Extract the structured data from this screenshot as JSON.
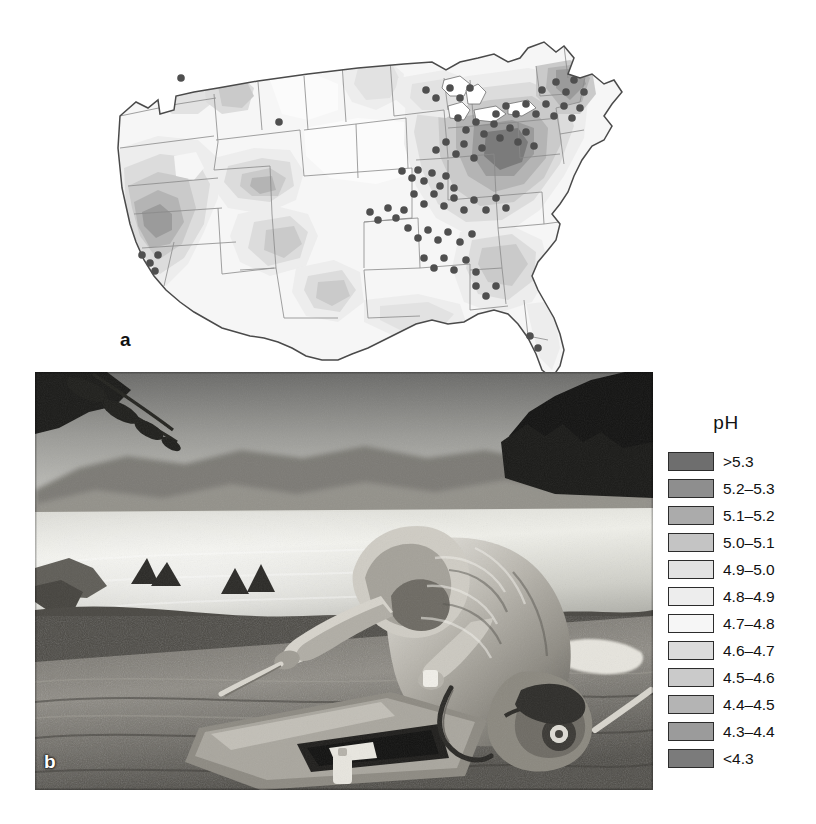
{
  "figure": {
    "panels": [
      {
        "id": "a",
        "label": "a",
        "kind": "map",
        "description": "Contour map of the contiguous United States showing precipitation pH, with monitoring-station dots concentrated in the eastern states"
      },
      {
        "id": "b",
        "label": "b",
        "kind": "photograph",
        "description": "Researcher in a hooded rain jacket crouching at a lake shore, collecting a water sample beside an open field instrument case"
      }
    ]
  },
  "legend": {
    "title": "pH",
    "entries": [
      {
        "label": ">5.3",
        "color": "#6e6e6e"
      },
      {
        "label": "5.2–5.3",
        "color": "#8e8e8e"
      },
      {
        "label": "5.1–5.2",
        "color": "#ababab"
      },
      {
        "label": "5.0–5.1",
        "color": "#c4c4c4"
      },
      {
        "label": "4.9–5.0",
        "color": "#e2e2e2"
      },
      {
        "label": "4.8–4.9",
        "color": "#ededed"
      },
      {
        "label": "4.7–4.8",
        "color": "#f6f6f6"
      },
      {
        "label": "4.6–4.7",
        "color": "#dcdcdc"
      },
      {
        "label": "4.5–4.6",
        "color": "#cacaca"
      },
      {
        "label": "4.4–4.5",
        "color": "#b4b4b4"
      },
      {
        "label": "4.3–4.4",
        "color": "#9b9b9b"
      },
      {
        "label": "<4.3",
        "color": "#7b7b7b"
      }
    ]
  },
  "chart_data": {
    "type": "map",
    "title": "pH",
    "variable": "precipitation pH",
    "region": "Contiguous United States",
    "grid": false,
    "legend_position": "right",
    "classes": [
      {
        "label": ">5.3",
        "min": 5.3,
        "max": null,
        "color": "#6e6e6e"
      },
      {
        "label": "5.2–5.3",
        "min": 5.2,
        "max": 5.3,
        "color": "#8e8e8e"
      },
      {
        "label": "5.1–5.2",
        "min": 5.1,
        "max": 5.2,
        "color": "#ababab"
      },
      {
        "label": "5.0–5.1",
        "min": 5.0,
        "max": 5.1,
        "color": "#c4c4c4"
      },
      {
        "label": "4.9–5.0",
        "min": 4.9,
        "max": 5.0,
        "color": "#e2e2e2"
      },
      {
        "label": "4.8–4.9",
        "min": 4.8,
        "max": 4.9,
        "color": "#ededed"
      },
      {
        "label": "4.7–4.8",
        "min": 4.7,
        "max": 4.8,
        "color": "#f6f6f6"
      },
      {
        "label": "4.6–4.7",
        "min": 4.6,
        "max": 4.7,
        "color": "#dcdcdc"
      },
      {
        "label": "4.5–4.6",
        "min": 4.5,
        "max": 4.6,
        "color": "#cacaca"
      },
      {
        "label": "4.4–4.5",
        "min": 4.4,
        "max": 4.5,
        "color": "#b4b4b4"
      },
      {
        "label": "4.3–4.4",
        "min": 4.3,
        "max": 4.4,
        "color": "#9b9b9b"
      },
      {
        "label": "<4.3",
        "min": null,
        "max": 4.3,
        "color": "#7b7b7b"
      }
    ],
    "station_marker": {
      "shape": "circle",
      "color": "#4f4f4f",
      "radius_px": 4
    }
  }
}
